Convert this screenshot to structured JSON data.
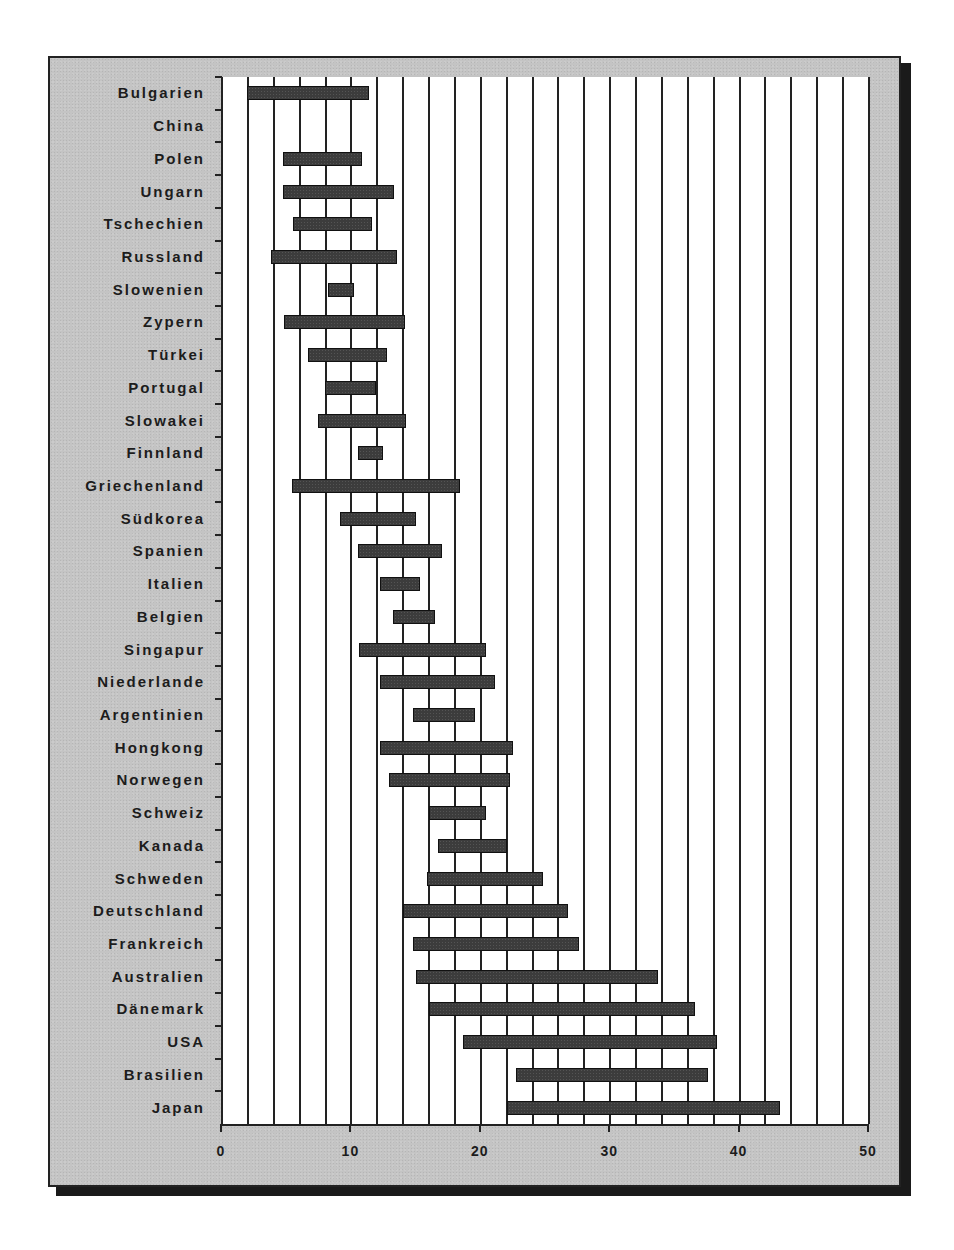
{
  "chart_data": {
    "type": "bar",
    "subtype": "floating-range-horizontal",
    "title": "",
    "xlabel": "",
    "ylabel": "",
    "xlim": [
      0,
      50
    ],
    "x_ticks": [
      0,
      10,
      20,
      30,
      40,
      50
    ],
    "x_gridline_step": 2,
    "grid": true,
    "legend": null,
    "categories": [
      "Bulgarien",
      "China",
      "Polen",
      "Ungarn",
      "Tschechien",
      "Russland",
      "Slowenien",
      "Zypern",
      "Türkei",
      "Portugal",
      "Slowakei",
      "Finnland",
      "Griechenland",
      "Südkorea",
      "Spanien",
      "Italien",
      "Belgien",
      "Singapur",
      "Niederlande",
      "Argentinien",
      "Hongkong",
      "Norwegen",
      "Schweiz",
      "Kanada",
      "Schweden",
      "Deutschland",
      "Frankreich",
      "Australien",
      "Dänemark",
      "USA",
      "Brasilien",
      "Japan"
    ],
    "series": [
      {
        "name": "min",
        "values": [
          2.0,
          null,
          4.8,
          4.8,
          5.6,
          3.9,
          8.3,
          4.9,
          6.7,
          8.0,
          7.5,
          10.6,
          5.5,
          9.2,
          10.6,
          12.3,
          13.3,
          10.7,
          12.3,
          14.8,
          12.3,
          13.0,
          16.1,
          16.8,
          15.9,
          14.1,
          14.8,
          15.1,
          16.1,
          18.7,
          22.8,
          22.1
        ]
      },
      {
        "name": "max",
        "values": [
          11.4,
          null,
          10.9,
          13.4,
          11.7,
          13.6,
          10.3,
          14.2,
          12.8,
          12.0,
          14.3,
          12.5,
          18.5,
          15.1,
          17.1,
          15.4,
          16.5,
          20.5,
          21.2,
          19.6,
          22.6,
          22.3,
          20.5,
          22.1,
          24.9,
          26.8,
          27.7,
          33.8,
          36.6,
          38.3,
          37.6,
          43.2
        ]
      }
    ]
  },
  "colors": {
    "frame_background": "#c4c4c4",
    "plot_background": "#ffffff",
    "bar_fill": "#3c3c3c",
    "gridline": "#222222",
    "shadow": "#1a1a1a"
  }
}
